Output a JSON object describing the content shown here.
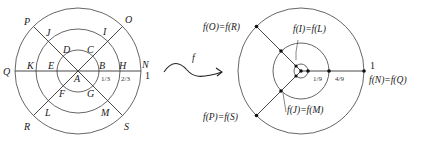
{
  "left_diagram": {
    "points": {
      "A": "A",
      "B": "B",
      "C": "C",
      "D": "D",
      "E": "E",
      "F": "F",
      "G": "G",
      "H": "H",
      "I": "I",
      "J": "J",
      "K": "K",
      "L": "L",
      "M": "M",
      "N": "N",
      "O": "O",
      "P": "P",
      "Q": "Q",
      "R": "R",
      "S": "S"
    },
    "radius_labels": {
      "inner": "1/3",
      "middle": "2/3",
      "outer": "1"
    }
  },
  "map_arrow": {
    "label": "f"
  },
  "right_diagram": {
    "labels": {
      "or": "f(O)=f(R)",
      "il": "f(I)=f(L)",
      "nq": "f(N)=f(Q)",
      "ps": "f(P)=f(S)",
      "jm": "f(J)=f(M)"
    },
    "radius_labels": {
      "inner": "1/9",
      "middle": "4/9",
      "outer": "1"
    }
  }
}
